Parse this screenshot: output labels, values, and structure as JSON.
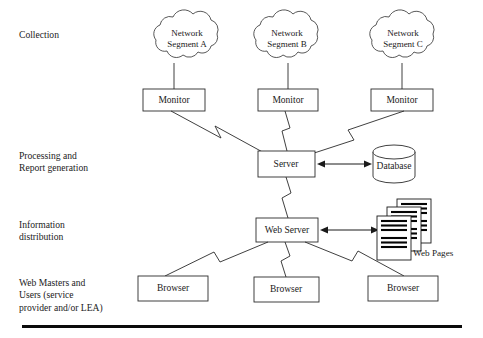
{
  "figure": {
    "background_color": "#ffffff",
    "line_color": "#2a2a2a",
    "text_color": "#1a1a1a"
  },
  "stages": [
    {
      "id": "collection",
      "label": "Collection"
    },
    {
      "id": "processing",
      "label": "Processing and\nReport generation"
    },
    {
      "id": "distribution",
      "label": "Information\ndistribution"
    },
    {
      "id": "consumers",
      "label": "Web Masters and\nUsers (service\nprovider and/or LEA)"
    }
  ],
  "clouds": [
    {
      "id": "segment-a",
      "line1": "Network",
      "line2": "Segment A"
    },
    {
      "id": "segment-b",
      "line1": "Network",
      "line2": "Segment B"
    },
    {
      "id": "segment-c",
      "line1": "Network",
      "line2": "Segment C"
    }
  ],
  "monitors": [
    {
      "id": "monitor-a",
      "label": "Monitor"
    },
    {
      "id": "monitor-b",
      "label": "Monitor"
    },
    {
      "id": "monitor-c",
      "label": "Monitor"
    }
  ],
  "server": {
    "label": "Server"
  },
  "database": {
    "label": "Database"
  },
  "web_server": {
    "label": "Web Server"
  },
  "web_pages": {
    "label": "Web Pages",
    "sheet_count": 3
  },
  "browsers": [
    {
      "id": "browser-1",
      "label": "Browser"
    },
    {
      "id": "browser-2",
      "label": "Browser"
    },
    {
      "id": "browser-3",
      "label": "Browser"
    }
  ],
  "connectors": {
    "server_database": {
      "type": "double-arrow"
    },
    "webserver_webpages": {
      "type": "double-arrow"
    },
    "monitor_to_server": {
      "type": "lightning"
    },
    "server_to_webserver": {
      "type": "lightning"
    },
    "webserver_to_browser": {
      "type": "lightning"
    }
  }
}
